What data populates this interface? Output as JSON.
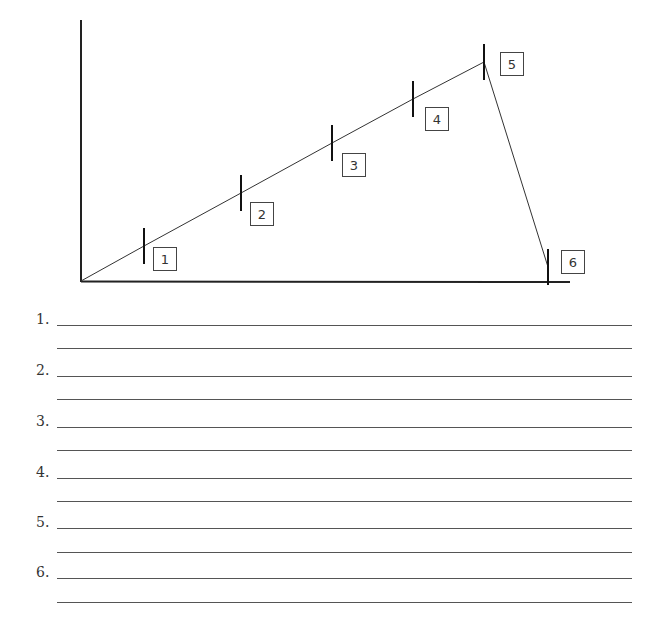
{
  "diagram": {
    "type": "line-graph-worksheet",
    "axes": {
      "origin": [
        81,
        281
      ],
      "y_axis_top": [
        81,
        20
      ],
      "x_axis_end": [
        570,
        282
      ],
      "color": "#222222"
    },
    "points": [
      {
        "label": "1",
        "tick": [
          144,
          246
        ],
        "box": [
          153,
          247
        ]
      },
      {
        "label": "2",
        "tick": [
          241,
          193
        ],
        "box": [
          250,
          202
        ]
      },
      {
        "label": "3",
        "tick": [
          332,
          143
        ],
        "box": [
          342,
          153
        ]
      },
      {
        "label": "4",
        "tick": [
          413,
          99
        ],
        "box": [
          425,
          107
        ]
      },
      {
        "label": "5",
        "tick": [
          484,
          62
        ],
        "box": [
          500,
          52
        ]
      },
      {
        "label": "6",
        "tick": [
          548,
          267
        ],
        "box": [
          561,
          250
        ]
      }
    ],
    "tick_half_height": 18,
    "box_size": 23
  },
  "answers": {
    "items": [
      {
        "number": "1.",
        "line_ys": [
          325,
          348
        ]
      },
      {
        "number": "2.",
        "line_ys": [
          376,
          399
        ]
      },
      {
        "number": "3.",
        "line_ys": [
          427,
          450
        ]
      },
      {
        "number": "4.",
        "line_ys": [
          478,
          501
        ]
      },
      {
        "number": "5.",
        "line_ys": [
          528,
          552
        ]
      },
      {
        "number": "6.",
        "line_ys": [
          578,
          602
        ]
      }
    ]
  }
}
